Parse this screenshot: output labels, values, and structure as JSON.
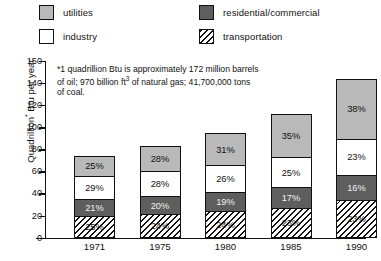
{
  "legend": {
    "items": [
      {
        "key": "utilities",
        "label": "utilities",
        "color": "#b9b9b9",
        "pattern": "solid"
      },
      {
        "key": "industry",
        "label": "industry",
        "color": "#ffffff",
        "pattern": "solid"
      },
      {
        "key": "residential",
        "label": "residential/commercial",
        "color": "#5e5e5e",
        "pattern": "solid"
      },
      {
        "key": "transportation",
        "label": "transportation",
        "color": "#ffffff",
        "pattern": "diagonal-hatch"
      }
    ]
  },
  "footnote": {
    "line1": "*1 quadrillion Btu is approximately 172 million barrels",
    "line2_a": "of oil; 970 billion ft",
    "line2_sup": "3",
    "line2_b": " of natural gas; 41,700,000 tons",
    "line3": "of coal."
  },
  "axis": {
    "ylabel_a": "Quadrillion",
    "ylabel_sup": "*",
    "ylabel_b": " Btu per year",
    "yticks": [
      "150",
      "140",
      "120",
      "100",
      "80",
      "60",
      "40",
      "20",
      "0"
    ]
  },
  "chart_data": {
    "type": "bar",
    "title": "",
    "subtitle": "",
    "xlabel": "",
    "ylabel": "Quadrillion* Btu per year",
    "ylim": [
      0,
      150
    ],
    "grid": false,
    "legend_position": "top",
    "stacked": true,
    "value_labels": "percent",
    "categories": [
      "1971",
      "1975",
      "1980",
      "1985",
      "1990"
    ],
    "totals": [
      70,
      78,
      89,
      105,
      135
    ],
    "series": [
      {
        "name": "utilities",
        "values": [
          25,
          28,
          31,
          35,
          38
        ],
        "unit": "%",
        "color": "#b9b9b9"
      },
      {
        "name": "industry",
        "values": [
          29,
          28,
          26,
          25,
          23
        ],
        "unit": "%",
        "color": "#ffffff"
      },
      {
        "name": "residential/commercial",
        "values": [
          21,
          20,
          19,
          17,
          16
        ],
        "unit": "%",
        "color": "#5e5e5e"
      },
      {
        "name": "transportation",
        "values": [
          25,
          24,
          24,
          23,
          23
        ],
        "unit": "%",
        "color": "#ffffff"
      }
    ],
    "bars": [
      {
        "category": "1971",
        "total": 70,
        "segments": [
          {
            "name": "utilities",
            "label": "25%"
          },
          {
            "name": "industry",
            "label": "29%"
          },
          {
            "name": "residential",
            "label": "21%"
          },
          {
            "name": "transportation",
            "label": "25%"
          }
        ]
      },
      {
        "category": "1975",
        "total": 78,
        "segments": [
          {
            "name": "utilities",
            "label": "28%"
          },
          {
            "name": "industry",
            "label": "28%"
          },
          {
            "name": "residential",
            "label": "20%"
          },
          {
            "name": "transportation",
            "label": "24%"
          }
        ]
      },
      {
        "category": "1980",
        "total": 89,
        "segments": [
          {
            "name": "utilities",
            "label": "31%"
          },
          {
            "name": "industry",
            "label": "26%"
          },
          {
            "name": "residential",
            "label": "19%"
          },
          {
            "name": "transportation",
            "label": "24%"
          }
        ]
      },
      {
        "category": "1985",
        "total": 105,
        "segments": [
          {
            "name": "utilities",
            "label": "35%"
          },
          {
            "name": "industry",
            "label": "25%"
          },
          {
            "name": "residential",
            "label": "17%"
          },
          {
            "name": "transportation",
            "label": "23%"
          }
        ]
      },
      {
        "category": "1990",
        "total": 135,
        "segments": [
          {
            "name": "utilities",
            "label": "38%"
          },
          {
            "name": "industry",
            "label": "23%"
          },
          {
            "name": "residential",
            "label": "16%"
          },
          {
            "name": "transportation",
            "label": "23%"
          }
        ]
      }
    ]
  }
}
